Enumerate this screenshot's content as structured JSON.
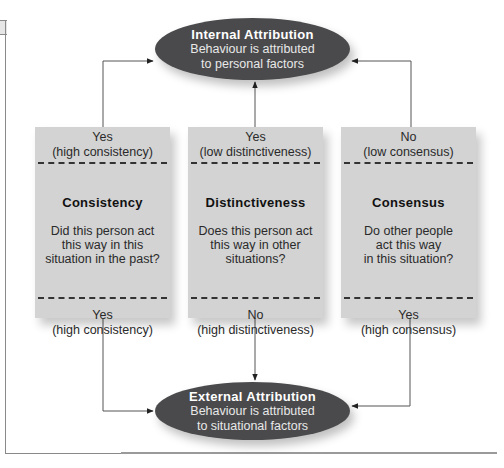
{
  "diagram": {
    "internal": {
      "title": "Internal Attribution",
      "line1": "Behaviour is attributed",
      "line2": "to personal factors"
    },
    "external": {
      "title": "External Attribution",
      "line1": "Behaviour is attributed",
      "line2": "to situational factors"
    },
    "boxes": [
      {
        "top_answer": "Yes",
        "top_detail": "(high consistency)",
        "heading": "Consistency",
        "question": [
          "Did this person act",
          "this way in this",
          "situation in the past?"
        ],
        "bottom_answer": "Yes",
        "bottom_detail": "(high consistency)"
      },
      {
        "top_answer": "Yes",
        "top_detail": "(low distinctiveness)",
        "heading": "Distinctiveness",
        "question": [
          "Does this person act",
          "this way in other",
          "situations?"
        ],
        "bottom_answer": "No",
        "bottom_detail": "(high distinctiveness)"
      },
      {
        "top_answer": "No",
        "top_detail": "(low consensus)",
        "heading": "Consensus",
        "question": [
          "Do other people",
          "act this way",
          "in this situation?"
        ],
        "bottom_answer": "Yes",
        "bottom_detail": "(high consensus)"
      }
    ],
    "colors": {
      "ellipse_fill": "#4a4a4c",
      "box_fill": "#d3d3d3",
      "connector": "#555555"
    }
  }
}
